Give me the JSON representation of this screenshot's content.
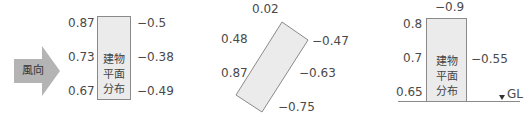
{
  "wind": {
    "label": "風向"
  },
  "building_label": [
    "建物",
    "平面",
    "分布"
  ],
  "panel1": {
    "windward": [
      "0.87",
      "0.73",
      "0.67"
    ],
    "leeward": [
      "−0.5",
      "−0.38",
      "−0.49"
    ]
  },
  "panel2": {
    "top": "0.02",
    "left_upper": "0.48",
    "left_lower": "0.87",
    "right_upper": "−0.47",
    "right_middle": "−0.63",
    "bottom": "−0.75"
  },
  "panel3": {
    "top": "−0.9",
    "windward": [
      "0.8",
      "0.7",
      "0.65"
    ],
    "leeward": "−0.55",
    "ground_label": "GL"
  },
  "colors": {
    "arrow": "#b4b4b4",
    "building_fill": "#ebebeb",
    "building_stroke": "#8a8a8a"
  }
}
